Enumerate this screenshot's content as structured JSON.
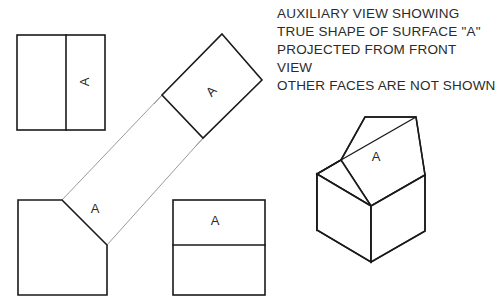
{
  "canvas": {
    "width": 498,
    "height": 303,
    "background": "#ffffff"
  },
  "style": {
    "line_color": "#1a1a1a",
    "projection_line_color": "#9a9a9a",
    "text_color": "#2b2b2b"
  },
  "notes": {
    "lines": [
      "AUXILIARY VIEW SHOWING",
      "TRUE SHAPE OF SURFACE \"A\"",
      "PROJECTED FROM FRONT",
      "VIEW",
      "OTHER FACES ARE NOT SHOWN"
    ],
    "origin_x": 277,
    "line_height": 18,
    "first_baseline_y": 18
  },
  "views": {
    "top_view": {
      "title": "top-view",
      "rect": {
        "x": 17,
        "y": 35,
        "width": 88,
        "height": 95
      },
      "divider": {
        "x": 66,
        "y1": 35,
        "y2": 130,
        "orientation": "vertical"
      },
      "label": {
        "text": "A",
        "x": 86,
        "y": 82,
        "rotation": -90
      }
    },
    "front_view": {
      "title": "front-view",
      "points": "18,200 62,200 107,245 107,295 18,295",
      "label": {
        "text": "A",
        "x": 93,
        "y": 209,
        "rotation": 0
      }
    },
    "auxiliary_view": {
      "title": "auxiliary-view",
      "points": "222,34 262,80 203,138 162,95",
      "label": {
        "text": "A",
        "x": 211,
        "y": 92,
        "rotation": -45
      }
    },
    "side_view": {
      "title": "side-view",
      "rect": {
        "x": 173,
        "y": 200,
        "width": 92,
        "height": 95
      },
      "divider": {
        "y": 245,
        "x1": 173,
        "x2": 265,
        "orientation": "horizontal"
      },
      "label": {
        "text": "A",
        "x": 215,
        "y": 221,
        "rotation": 0
      }
    },
    "isometric_view": {
      "title": "isometric-pictorial-view",
      "label": {
        "text": "A",
        "x": 375,
        "y": 157,
        "rotation": 0
      },
      "front_face": "317,174 317,230 371,262 371,206",
      "right_face": "371,206 371,262 425,231 425,175",
      "sloped_face_a": "317,174 341,160 416,117 425,175 371,206",
      "top_face": "341,160 365,117 416,117 341,160",
      "left_face": "317,174 317,230 341,216 341,160",
      "outline": "317,174 341,160 365,117 416,117 425,175 425,231 371,262 317,230",
      "edges": [
        "317,174 371,206",
        "371,206 371,262",
        "371,206 425,175",
        "341,160 416,117",
        "317,174 341,160",
        "341,160 365,117"
      ]
    }
  },
  "projection_lines": [
    {
      "name": "chamfer-upper-projection",
      "x1": 62,
      "y1": 200,
      "x2": 162,
      "y2": 95
    },
    {
      "name": "chamfer-lower-projection",
      "x1": 107,
      "y1": 245,
      "x2": 203,
      "y2": 138
    },
    {
      "name": "aux-extension-left",
      "x1": 155,
      "y1": 103,
      "x2": 166,
      "y2": 91
    },
    {
      "name": "aux-extension-bottom",
      "x1": 196,
      "y1": 146,
      "x2": 207,
      "y2": 134
    }
  ]
}
